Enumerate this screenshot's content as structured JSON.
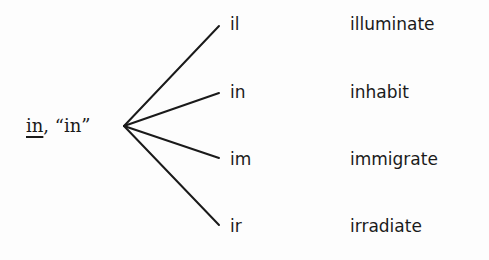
{
  "diagram": {
    "root": {
      "prefix": "in",
      "separator": ", ",
      "meaning": "“in”"
    },
    "branches": [
      {
        "variant": "il",
        "example": "illuminate"
      },
      {
        "variant": "in",
        "example": "inhabit"
      },
      {
        "variant": "im",
        "example": "immigrate"
      },
      {
        "variant": "ir",
        "example": "irradiate"
      }
    ],
    "line_color": "#1a1a1a"
  }
}
